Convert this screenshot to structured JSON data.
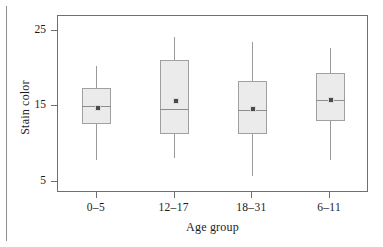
{
  "chart_data": {
    "type": "box",
    "title": "",
    "xlabel": "Age group",
    "ylabel": "Stain color",
    "categories": [
      "0–5",
      "12–17",
      "18–31",
      "6–11"
    ],
    "ylim": [
      3.5,
      27.0
    ],
    "yticks": [
      5,
      15,
      25
    ],
    "ytick_labels": [
      "5",
      "15",
      "25"
    ],
    "grid": false,
    "legend": null,
    "mean_marker": "filled-square",
    "boxes": [
      {
        "category": "0–5",
        "whisker_low": 7.9,
        "q1": 12.7,
        "median": 15.0,
        "q3": 17.5,
        "whisker_high": 20.4,
        "mean": 14.9
      },
      {
        "category": "12–17",
        "whisker_low": 8.2,
        "q1": 11.3,
        "median": 14.6,
        "q3": 21.1,
        "whisker_high": 24.2,
        "mean": 15.9
      },
      {
        "category": "18–31",
        "whisker_low": 5.7,
        "q1": 11.3,
        "median": 14.5,
        "q3": 18.4,
        "whisker_high": 23.5,
        "mean": 14.8
      },
      {
        "category": "6–11",
        "whisker_low": 7.9,
        "q1": 13.1,
        "median": 15.8,
        "q3": 19.4,
        "whisker_high": 22.8,
        "mean": 16.0
      }
    ],
    "colors": {
      "box_fill": "#ebebeb",
      "box_edge": "#a0a0a0",
      "whisker": "#9a9a9a",
      "median": "#8d8d8d",
      "mean": "#4a4a4a",
      "axis": "#6f6f6f",
      "text": "#1b1b1b",
      "background": "#ffffff"
    }
  },
  "axes": {
    "y": {
      "title": "Stain color",
      "ticks": [
        {
          "label": "25",
          "value": 25
        },
        {
          "label": "15",
          "value": 15
        },
        {
          "label": "5",
          "value": 5
        }
      ]
    },
    "x": {
      "title": "Age group",
      "ticks": [
        {
          "label": "0–5"
        },
        {
          "label": "12–17"
        },
        {
          "label": "18–31"
        },
        {
          "label": "6–11"
        }
      ]
    }
  }
}
